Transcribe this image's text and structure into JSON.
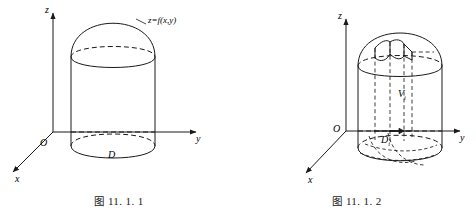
{
  "page": {
    "background": "#ffffff",
    "stroke_color": "#1a1a1a",
    "width": 476,
    "height": 210
  },
  "figures": [
    {
      "id": "figure-11-1-1",
      "caption_prefix": "图",
      "caption_number": "11. 1. 1",
      "caption": "图 11. 1. 1",
      "axes": {
        "x": "x",
        "y": "y",
        "z": "z",
        "origin": "O"
      },
      "labels": {
        "surface": "z=f(x,y)",
        "region": "D"
      },
      "description": "Curvilinear-top cylinder (曲顶柱体) over region D with top surface z=f(x,y)"
    },
    {
      "id": "figure-11-1-2",
      "caption_prefix": "图",
      "caption_number": "11. 1. 2",
      "caption": "图 11. 1. 2",
      "axes": {
        "x": "x",
        "y": "y",
        "z": "z",
        "origin": "O"
      },
      "labels": {
        "subregion": "D",
        "subregion_subscript": "i",
        "subvolume": "V",
        "subvolume_subscript": "i"
      },
      "description": "Same cylinder partitioned into small regions D_i with corresponding small column of volume V_i"
    }
  ]
}
